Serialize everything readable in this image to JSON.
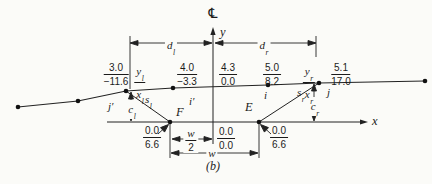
{
  "figure": {
    "caption": "(b)",
    "centerline_symbol": "℄",
    "colors": {
      "ink": "#1b1b1b",
      "background": "#fbfbf8"
    },
    "axes": {
      "x_label": "x",
      "y_label": "y"
    },
    "top_fractions": [
      {
        "num": "3.0",
        "den": "−11.6"
      },
      {
        "num": "y",
        "num_sub": "l",
        "den": "x",
        "den_sub": "l"
      },
      {
        "num": "4.0",
        "den": "−3.3"
      },
      {
        "num": "4.3",
        "den": "0.0"
      },
      {
        "num": "5.0",
        "den": "8.2"
      },
      {
        "num": "y",
        "num_sub": "r",
        "den": "x",
        "den_sub": "r"
      },
      {
        "num": "5.1",
        "den": "17.0"
      }
    ],
    "bottom_fractions": [
      {
        "num": "0.0",
        "den": "6.6"
      },
      {
        "num": "0.0",
        "den": "0.0"
      },
      {
        "num": "0.0",
        "den": "6.6"
      }
    ],
    "dims": {
      "d_left": {
        "base": "d",
        "sub": "l"
      },
      "d_right": {
        "base": "d",
        "sub": "r"
      },
      "s_left": {
        "base": "s",
        "sub": "l"
      },
      "s_right": {
        "base": "s",
        "sub": "r"
      },
      "c_left": {
        "base": "c",
        "sub": "l"
      },
      "c_right": {
        "base": "c",
        "sub": "r"
      },
      "w_label": "w",
      "w_half": {
        "num": "w",
        "den": "2"
      }
    },
    "point_labels": {
      "F": "F",
      "E": "E",
      "i": "i",
      "i_prime": "i′",
      "j": "j",
      "j_prime": "j′"
    }
  }
}
